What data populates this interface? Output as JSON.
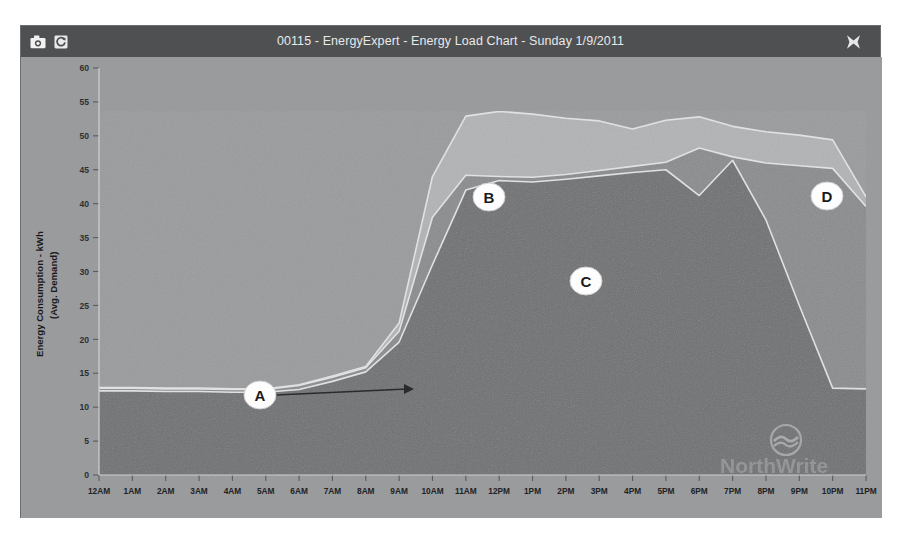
{
  "window": {
    "title": "00115 - EnergyExpert - Energy Load Chart - Sunday 1/9/2011",
    "toolbar": {
      "camera_label": "camera-icon",
      "refresh_label": "refresh-icon",
      "close_label": "close-icon"
    }
  },
  "watermark": {
    "text": "NorthWrite",
    "logo": "wave-circle-logo"
  },
  "colors": {
    "titlebar_bg": "#4f5052",
    "titlebar_text": "#e8e9ea",
    "plot_bg": "#9a9b9d",
    "band_total": "#a9aaac",
    "band_upper": "#b2b3b5",
    "band_base": "#6f7072",
    "band_mid": "#8a8b8d",
    "line_light": "#e3e4e5",
    "callout_fill": "#fdfdfd",
    "callout_text": "#1a1a1c"
  },
  "chart_data": {
    "type": "area",
    "title": "Energy Load Chart",
    "xlabel": "",
    "ylabel": "Energy Consumption - kWh\n(Avg. Demand)",
    "ylim": [
      0,
      60
    ],
    "yticks": [
      0,
      5,
      10,
      15,
      20,
      25,
      30,
      35,
      40,
      45,
      50,
      55,
      60
    ],
    "grid": false,
    "legend": "none",
    "categories": [
      "12AM",
      "1AM",
      "2AM",
      "3AM",
      "4AM",
      "5AM",
      "6AM",
      "7AM",
      "8AM",
      "9AM",
      "10AM",
      "11AM",
      "12PM",
      "1PM",
      "2PM",
      "3PM",
      "4PM",
      "5PM",
      "6PM",
      "7PM",
      "8PM",
      "9PM",
      "10PM",
      "11PM"
    ],
    "series": [
      {
        "name": "Base Load",
        "color": "#6f7072",
        "values": [
          12.4,
          12.4,
          12.3,
          12.3,
          12.2,
          12.2,
          12.6,
          13.8,
          15.2,
          19.6,
          31.0,
          42.0,
          43.4,
          43.2,
          43.6,
          44.1,
          44.6,
          45.0,
          41.2,
          46.4,
          37.6,
          25.0,
          12.8,
          12.7
        ]
      },
      {
        "name": "Mid Band",
        "color": "#8a8b8d",
        "values": [
          12.8,
          12.8,
          12.7,
          12.7,
          12.6,
          12.6,
          13.2,
          14.4,
          15.8,
          21.2,
          38.0,
          44.2,
          44.0,
          43.9,
          44.3,
          44.9,
          45.5,
          46.1,
          48.2,
          46.9,
          46.0,
          45.6,
          45.2,
          39.6
        ]
      },
      {
        "name": "Total Load",
        "color": "#b2b3b5",
        "values": [
          12.9,
          12.9,
          12.8,
          12.8,
          12.7,
          12.7,
          13.3,
          14.6,
          16.0,
          22.4,
          44.0,
          52.9,
          53.6,
          53.2,
          52.6,
          52.2,
          51.0,
          52.3,
          52.8,
          51.4,
          50.6,
          50.1,
          49.4,
          41.0
        ]
      }
    ],
    "annotations": [
      {
        "label": "A",
        "x_px": 239,
        "y_px": 338,
        "arrow": true,
        "arrow_to_x_px": 393,
        "arrow_to_y_px": 332
      },
      {
        "label": "B",
        "x_px": 468,
        "y_px": 140,
        "arrow": false,
        "arrow_to_x_px": 0,
        "arrow_to_y_px": 0
      },
      {
        "label": "C",
        "x_px": 565,
        "y_px": 224,
        "arrow": false,
        "arrow_to_x_px": 0,
        "arrow_to_y_px": 0
      },
      {
        "label": "D",
        "x_px": 806,
        "y_px": 139,
        "arrow": false,
        "arrow_to_x_px": 0,
        "arrow_to_y_px": 0
      }
    ]
  }
}
